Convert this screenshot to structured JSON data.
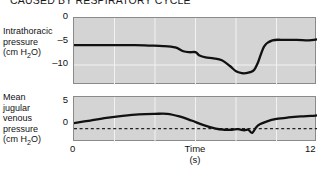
{
  "figure": {
    "title": "CAUSED BY RESPIRATORY CYCLE",
    "background_color": "#ffffff",
    "panel_color": "#d4d4d4",
    "grid_color": "#f2f2f2",
    "trace_color": "#111111"
  },
  "chart_data": {
    "type": "line",
    "title": "CAUSED BY RESPIRATORY CYCLE",
    "xlabel": "Time",
    "xlabel_units": "(s)",
    "xlim": [
      0,
      12
    ],
    "xticks": [
      0,
      12
    ],
    "xtick_labels": [
      "0",
      "12"
    ],
    "grid": true,
    "grid_x_spacing": 2,
    "legend": "none",
    "panels": [
      {
        "name": "intrathoracic-pressure",
        "ylabel": "Intrathoracic pressure (cm H2O)",
        "ylabel_lines": [
          "Intrathoracic",
          "pressure",
          "(cm H",
          "2",
          "O)"
        ],
        "yunits": "cm H2O",
        "ylim": [
          -13.5,
          0.6
        ],
        "yticks": [
          0,
          -5,
          -10
        ],
        "ytick_labels": [
          "0",
          "–5",
          "–10"
        ],
        "zero_reference_line": false,
        "x": [
          0.0,
          0.6,
          1.4,
          2.2,
          3.0,
          3.7,
          4.4,
          5.0,
          5.4,
          5.7,
          6.0,
          6.2,
          6.5,
          6.9,
          7.3,
          7.7,
          8.0,
          8.3,
          8.5,
          8.7,
          8.9,
          9.1,
          9.4,
          9.8,
          10.4,
          11.0,
          11.6,
          12.0
        ],
        "y": [
          -5.1,
          -5.1,
          -5.1,
          -5.1,
          -5.1,
          -5.2,
          -5.3,
          -5.6,
          -6.4,
          -6.6,
          -6.6,
          -7.3,
          -7.7,
          -7.9,
          -8.3,
          -9.5,
          -10.6,
          -11.0,
          -11.0,
          -10.8,
          -10.3,
          -8.6,
          -5.3,
          -4.1,
          -4.0,
          -4.0,
          -4.1,
          -3.9
        ]
      },
      {
        "name": "mean-jugular-venous-pressure",
        "ylabel": "Mean jugular venous pressure (cm H2O)",
        "ylabel_lines": [
          "Mean",
          "jugular",
          "venous",
          "pressure",
          "(cm H",
          "2",
          "O)"
        ],
        "yunits": "cm H2O",
        "ylim": [
          -2.6,
          6.2
        ],
        "yticks": [
          5,
          0
        ],
        "ytick_labels": [
          "5",
          "0"
        ],
        "zero_reference_line": true,
        "x": [
          0.0,
          0.8,
          1.6,
          2.4,
          3.2,
          4.0,
          4.6,
          5.2,
          5.8,
          6.4,
          7.0,
          7.4,
          7.8,
          8.1,
          8.4,
          8.6,
          8.8,
          9.0,
          9.2,
          9.5,
          10.0,
          10.6,
          11.2,
          11.7,
          12.0
        ],
        "y": [
          1.1,
          1.6,
          2.1,
          2.5,
          2.8,
          2.9,
          2.9,
          2.4,
          1.6,
          0.7,
          0.0,
          -0.2,
          -0.2,
          -0.1,
          -0.3,
          -0.2,
          -0.8,
          0.3,
          0.9,
          1.4,
          1.9,
          2.2,
          2.4,
          2.5,
          2.6
        ]
      }
    ]
  }
}
